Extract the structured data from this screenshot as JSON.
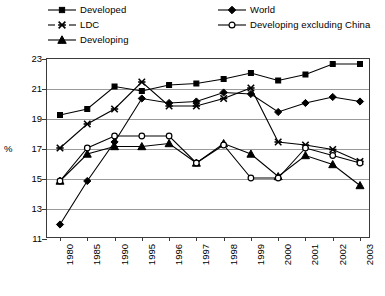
{
  "chart_data": {
    "type": "line",
    "title": "",
    "subtitle": "",
    "xlabel": "",
    "ylabel": "%",
    "ylim": [
      11,
      23
    ],
    "ytick_step": 2,
    "yticks": [
      "23",
      "21",
      "19",
      "17",
      "15",
      "13",
      "11"
    ],
    "grid": true,
    "legend_position": "top",
    "categories": [
      "1980",
      "1985",
      "1990",
      "1995",
      "1996",
      "1997",
      "1998",
      "1999",
      "2000",
      "2001",
      "2002",
      "2003"
    ],
    "series": [
      {
        "name": "Developed",
        "marker": "filled-square",
        "values": [
          19.2,
          19.6,
          21.1,
          20.8,
          21.2,
          21.3,
          21.6,
          22.0,
          21.5,
          21.9,
          22.6,
          22.6
        ]
      },
      {
        "name": "LDC",
        "marker": "cross-x",
        "values": [
          17.0,
          18.6,
          19.6,
          21.4,
          19.8,
          19.8,
          20.3,
          21.0,
          17.4,
          17.2,
          16.9,
          16.1
        ]
      },
      {
        "name": "Developing",
        "marker": "filled-triangle",
        "values": [
          14.8,
          16.6,
          17.1,
          17.1,
          17.3,
          16.0,
          17.3,
          16.6,
          15.1,
          16.5,
          15.9,
          14.5
        ]
      },
      {
        "name": "World",
        "marker": "filled-diamond",
        "values": [
          11.9,
          14.8,
          17.4,
          20.3,
          20.0,
          20.1,
          20.7,
          20.6,
          19.4,
          20.0,
          20.4,
          20.1
        ]
      },
      {
        "name": "Developing excluding China",
        "marker": "hollow-circle",
        "values": [
          14.8,
          17.0,
          17.8,
          17.8,
          17.8,
          16.0,
          17.2,
          15.0,
          15.0,
          17.0,
          16.5,
          16.0
        ]
      }
    ]
  },
  "legend": {
    "items": [
      {
        "label": "Developed",
        "marker": "filled-square",
        "col": 1,
        "row": 1
      },
      {
        "label": "LDC",
        "marker": "cross-x",
        "col": 1,
        "row": 2
      },
      {
        "label": "Developing",
        "marker": "filled-triangle",
        "col": 1,
        "row": 3
      },
      {
        "label": "World",
        "marker": "filled-diamond",
        "col": 2,
        "row": 1
      },
      {
        "label": "Developing excluding China",
        "marker": "hollow-circle",
        "col": 2,
        "row": 2
      }
    ]
  }
}
